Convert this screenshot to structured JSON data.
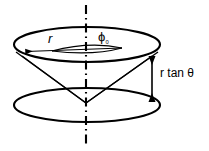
{
  "figure": {
    "type": "line-diagram",
    "background_color": "#ffffff",
    "stroke_color": "#000000",
    "labels": {
      "radius": "r",
      "azimuth_symbol": "ϕ",
      "azimuth_subscript": "₀",
      "height": "r tan θ"
    },
    "elements": {
      "upper_circle_name": "upper-circle",
      "lower_circle_name": "lower-circle",
      "axis_name": "vertical-axis",
      "cone_name": "cone-surface",
      "radius_arrow_name": "radius-arrow",
      "height_arrow_name": "height-arrow",
      "angle_arc_name": "azimuth-angle-arc"
    },
    "geometry": {
      "upper_ellipse": {
        "cx": 87,
        "cy": 44.5,
        "rx": 73,
        "ry": 17.5
      },
      "lower_ellipse": {
        "cx": 87,
        "cy": 105,
        "rx": 73,
        "ry": 17
      },
      "apex": {
        "x": 86,
        "y": 103
      },
      "axis_top": {
        "x": 86,
        "y": 5
      },
      "axis_bottom": {
        "x": 86,
        "y": 146
      },
      "height_arrow_x": 152,
      "height_arrow_top_y": 57,
      "height_arrow_bottom_y": 101
    }
  }
}
